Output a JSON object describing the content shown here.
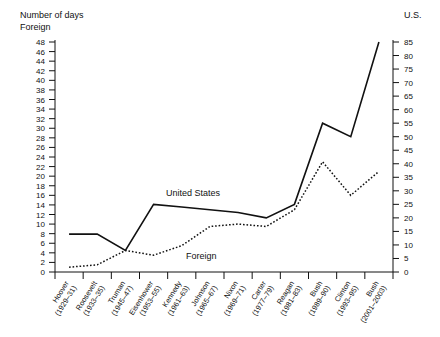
{
  "chart_data": {
    "type": "line",
    "title": "",
    "subtitle": "",
    "ylabel_left_line1": "Number of days",
    "ylabel_left_line2": "Foreign",
    "ylabel_right": "U.S.",
    "xlabel": "",
    "grid": false,
    "legend_position": "inline-annotations",
    "ylim_left": [
      0,
      48
    ],
    "ytick_step_left": 2,
    "yticks_left": [
      0,
      2,
      4,
      6,
      8,
      10,
      12,
      14,
      16,
      18,
      20,
      22,
      24,
      26,
      28,
      30,
      32,
      34,
      36,
      38,
      40,
      42,
      44,
      46,
      48
    ],
    "ylim_right": [
      0,
      85
    ],
    "ytick_step_right": 5,
    "yticks_right": [
      0,
      5,
      10,
      15,
      20,
      25,
      30,
      35,
      40,
      45,
      50,
      55,
      60,
      65,
      70,
      75,
      80,
      85
    ],
    "categories": [
      "Hoover\n(1929–31)",
      "Roosevelt\n(1933–35)",
      "Truman\n(1945–47)",
      "Eisenhower\n(1953–55)",
      "Kennedy\n(1961–63)",
      "Johnson\n(1965–67)",
      "Nixon\n(1969–71)",
      "Carter\n(1977–79)",
      "Reagan\n(1981–83)",
      "Bush\n(1989–90)",
      "Clinton\n(1993–95)",
      "Bush\n(2001–2003)"
    ],
    "category_names": [
      "Hoover",
      "Roosevelt",
      "Truman",
      "Eisenhower",
      "Kennedy",
      "Johnson",
      "Nixon",
      "Carter",
      "Reagan",
      "Bush",
      "Clinton",
      "Bush"
    ],
    "category_years": [
      "(1929–31)",
      "(1933–35)",
      "(1945–47)",
      "(1953–55)",
      "(1961–63)",
      "(1965–67)",
      "(1969–71)",
      "(1977–79)",
      "(1981–83)",
      "(1989–90)",
      "(1993–95)",
      "(2001–2003)"
    ],
    "series": [
      {
        "name": "United States",
        "style": "solid",
        "axis": "right",
        "values_left_scale": [
          8,
          8,
          4.5,
          14,
          13.5,
          13,
          12.5,
          11,
          14,
          31,
          28,
          48
        ],
        "values": [
          14,
          14,
          8,
          25,
          24,
          23,
          22,
          20,
          25,
          55,
          50,
          85
        ]
      },
      {
        "name": "Foreign",
        "style": "dotted",
        "axis": "left",
        "values_left_scale": [
          1,
          1.5,
          4.5,
          3.5,
          5.5,
          9.5,
          10,
          9.5,
          13,
          23,
          16,
          21
        ],
        "values": [
          1,
          1.5,
          4.5,
          3.5,
          5.5,
          9.5,
          10,
          9.5,
          13,
          23,
          16,
          21
        ]
      }
    ],
    "annotations": [
      {
        "text": "United States",
        "near_category": "Eisenhower"
      },
      {
        "text": "Foreign",
        "near_category": "Johnson"
      }
    ]
  },
  "figure": {
    "left_axis_heading_line1": "Number of days",
    "left_axis_heading_line2": "Foreign",
    "right_axis_heading": "U.S."
  }
}
